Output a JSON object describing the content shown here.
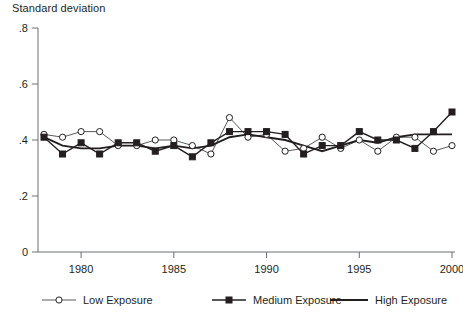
{
  "chart_data": {
    "type": "line",
    "title": "",
    "ylabel": "Standard deviation",
    "xlabel": "",
    "ylim": [
      0,
      0.8
    ],
    "xlim": [
      1978,
      2000
    ],
    "grid": false,
    "legend_position": "bottom",
    "ytick_labels": [
      "0",
      ".2",
      ".4",
      ".6",
      ".8"
    ],
    "ytick_values": [
      0,
      0.2,
      0.4,
      0.6,
      0.8
    ],
    "xtick_labels": [
      "1980",
      "1985",
      "1990",
      "1995",
      "2000"
    ],
    "xtick_values": [
      1980,
      1985,
      1990,
      1995,
      2000
    ],
    "x": [
      1978,
      1979,
      1980,
      1981,
      1982,
      1983,
      1984,
      1985,
      1986,
      1987,
      1988,
      1989,
      1990,
      1991,
      1992,
      1993,
      1994,
      1995,
      1996,
      1997,
      1998,
      1999,
      2000
    ],
    "series": [
      {
        "name": "Low Exposure",
        "marker": "open-circle",
        "values": [
          0.42,
          0.41,
          0.43,
          0.43,
          0.38,
          0.38,
          0.4,
          0.4,
          0.38,
          0.35,
          0.48,
          0.41,
          0.42,
          0.36,
          0.37,
          0.41,
          0.37,
          0.4,
          0.36,
          0.41,
          0.41,
          0.36,
          0.38
        ]
      },
      {
        "name": "Medium Exposure",
        "marker": "filled-square",
        "values": [
          0.41,
          0.35,
          0.39,
          0.35,
          0.39,
          0.39,
          0.36,
          0.38,
          0.34,
          0.39,
          0.43,
          0.43,
          0.43,
          0.42,
          0.35,
          0.38,
          0.38,
          0.43,
          0.4,
          0.4,
          0.37,
          0.43,
          0.5
        ]
      },
      {
        "name": "High Exposure",
        "marker": "none",
        "values": [
          0.41,
          0.38,
          0.37,
          0.37,
          0.38,
          0.38,
          0.37,
          0.38,
          0.37,
          0.38,
          0.41,
          0.42,
          0.41,
          0.4,
          0.38,
          0.36,
          0.38,
          0.4,
          0.39,
          0.41,
          0.42,
          0.42,
          0.42
        ]
      }
    ],
    "legend_entries": [
      {
        "label": "Low Exposure",
        "marker": "open-circle"
      },
      {
        "label": "Medium Exposure",
        "marker": "filled-square"
      },
      {
        "label": "High Exposure",
        "marker": "none"
      }
    ],
    "colors": {
      "low_line": "#58595b",
      "medium_line": "#231f20",
      "high_line": "#231f20",
      "axis": "#6d6e71",
      "text": "#231f20",
      "background": "#ffffff"
    }
  }
}
